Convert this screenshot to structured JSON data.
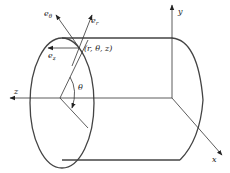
{
  "figure": {
    "axes": {
      "x": "x",
      "y": "y",
      "z": "z"
    },
    "unit_vectors": {
      "e_theta": "θ",
      "e_r": "r",
      "e_z": "z",
      "e": "e"
    },
    "point_label": "(r,  θ,  z)",
    "angle_label": "θ"
  }
}
